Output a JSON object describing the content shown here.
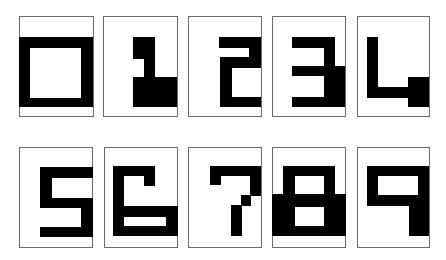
{
  "colors": {
    "ink": "#000000",
    "paper": "#ffffff",
    "card_border": "#6a6a6a"
  },
  "cards": [
    {
      "digit": "0",
      "box": [
        19,
        16,
        75,
        101
      ],
      "rects": [
        {
          "x": 19,
          "y": 37,
          "w": 74,
          "h": 70,
          "c": "ink"
        },
        {
          "x": 30,
          "y": 48,
          "w": 51,
          "h": 50,
          "c": "paper"
        }
      ]
    },
    {
      "digit": "1",
      "box": [
        103,
        16,
        75,
        101
      ],
      "rects": [
        {
          "x": 133,
          "y": 37,
          "w": 22,
          "h": 22,
          "c": "ink"
        },
        {
          "x": 144,
          "y": 59,
          "w": 11,
          "h": 19,
          "c": "ink"
        },
        {
          "x": 133,
          "y": 77,
          "w": 44,
          "h": 30,
          "c": "ink"
        }
      ]
    },
    {
      "digit": "2",
      "box": [
        188,
        16,
        74,
        101
      ],
      "rects": [
        {
          "x": 219,
          "y": 37,
          "w": 42,
          "h": 11,
          "c": "ink"
        },
        {
          "x": 249,
          "y": 37,
          "w": 12,
          "h": 31,
          "c": "ink"
        },
        {
          "x": 220,
          "y": 57,
          "w": 41,
          "h": 11,
          "c": "ink"
        },
        {
          "x": 220,
          "y": 57,
          "w": 12,
          "h": 50,
          "c": "ink"
        },
        {
          "x": 220,
          "y": 97,
          "w": 41,
          "h": 10,
          "c": "ink"
        }
      ]
    },
    {
      "digit": "3",
      "box": [
        272,
        16,
        74,
        101
      ],
      "rects": [
        {
          "x": 292,
          "y": 37,
          "w": 43,
          "h": 11,
          "c": "ink"
        },
        {
          "x": 324,
          "y": 37,
          "w": 11,
          "h": 39,
          "c": "ink"
        },
        {
          "x": 292,
          "y": 66,
          "w": 53,
          "h": 10,
          "c": "ink"
        },
        {
          "x": 324,
          "y": 66,
          "w": 21,
          "h": 41,
          "c": "ink"
        },
        {
          "x": 292,
          "y": 97,
          "w": 53,
          "h": 10,
          "c": "ink"
        }
      ]
    },
    {
      "digit": "4",
      "box": [
        357,
        16,
        73,
        101
      ],
      "rects": [
        {
          "x": 367,
          "y": 37,
          "w": 11,
          "h": 61,
          "c": "ink"
        },
        {
          "x": 367,
          "y": 87,
          "w": 43,
          "h": 11,
          "c": "ink"
        },
        {
          "x": 408,
          "y": 77,
          "w": 21,
          "h": 30,
          "c": "ink"
        }
      ]
    },
    {
      "digit": "5",
      "box": [
        19,
        147,
        74,
        101
      ],
      "rects": [
        {
          "x": 40,
          "y": 167,
          "w": 53,
          "h": 11,
          "c": "ink"
        },
        {
          "x": 40,
          "y": 167,
          "w": 12,
          "h": 41,
          "c": "ink"
        },
        {
          "x": 40,
          "y": 198,
          "w": 53,
          "h": 10,
          "c": "ink"
        },
        {
          "x": 81,
          "y": 198,
          "w": 12,
          "h": 39,
          "c": "ink"
        },
        {
          "x": 40,
          "y": 227,
          "w": 53,
          "h": 10,
          "c": "ink"
        }
      ]
    },
    {
      "digit": "6",
      "box": [
        104,
        147,
        74,
        101
      ],
      "rects": [
        {
          "x": 113,
          "y": 166,
          "w": 42,
          "h": 10,
          "c": "ink"
        },
        {
          "x": 144,
          "y": 166,
          "w": 11,
          "h": 20,
          "c": "ink"
        },
        {
          "x": 113,
          "y": 166,
          "w": 11,
          "h": 70,
          "c": "ink"
        },
        {
          "x": 113,
          "y": 206,
          "w": 65,
          "h": 30,
          "c": "ink"
        },
        {
          "x": 124,
          "y": 217,
          "w": 42,
          "h": 9,
          "c": "paper"
        }
      ]
    },
    {
      "digit": "7",
      "box": [
        188,
        147,
        74,
        101
      ],
      "rects": [
        {
          "x": 210,
          "y": 166,
          "w": 51,
          "h": 10,
          "c": "ink"
        },
        {
          "x": 210,
          "y": 166,
          "w": 11,
          "h": 19,
          "c": "ink"
        },
        {
          "x": 250,
          "y": 166,
          "w": 11,
          "h": 30,
          "c": "ink"
        },
        {
          "x": 241,
          "y": 195,
          "w": 10,
          "h": 11,
          "c": "ink"
        },
        {
          "x": 231,
          "y": 205,
          "w": 11,
          "h": 31,
          "c": "ink"
        }
      ]
    },
    {
      "digit": "8",
      "box": [
        272,
        147,
        74,
        101
      ],
      "rects": [
        {
          "x": 283,
          "y": 166,
          "w": 52,
          "h": 30,
          "c": "ink"
        },
        {
          "x": 295,
          "y": 176,
          "w": 29,
          "h": 18,
          "c": "paper"
        },
        {
          "x": 272,
          "y": 194,
          "w": 74,
          "h": 42,
          "c": "ink"
        },
        {
          "x": 295,
          "y": 207,
          "w": 29,
          "h": 19,
          "c": "paper"
        }
      ]
    },
    {
      "digit": "9",
      "box": [
        357,
        147,
        73,
        101
      ],
      "rects": [
        {
          "x": 367,
          "y": 166,
          "w": 62,
          "h": 40,
          "c": "ink"
        },
        {
          "x": 378,
          "y": 176,
          "w": 40,
          "h": 19,
          "c": "paper"
        },
        {
          "x": 409,
          "y": 206,
          "w": 20,
          "h": 30,
          "c": "ink"
        }
      ]
    }
  ]
}
